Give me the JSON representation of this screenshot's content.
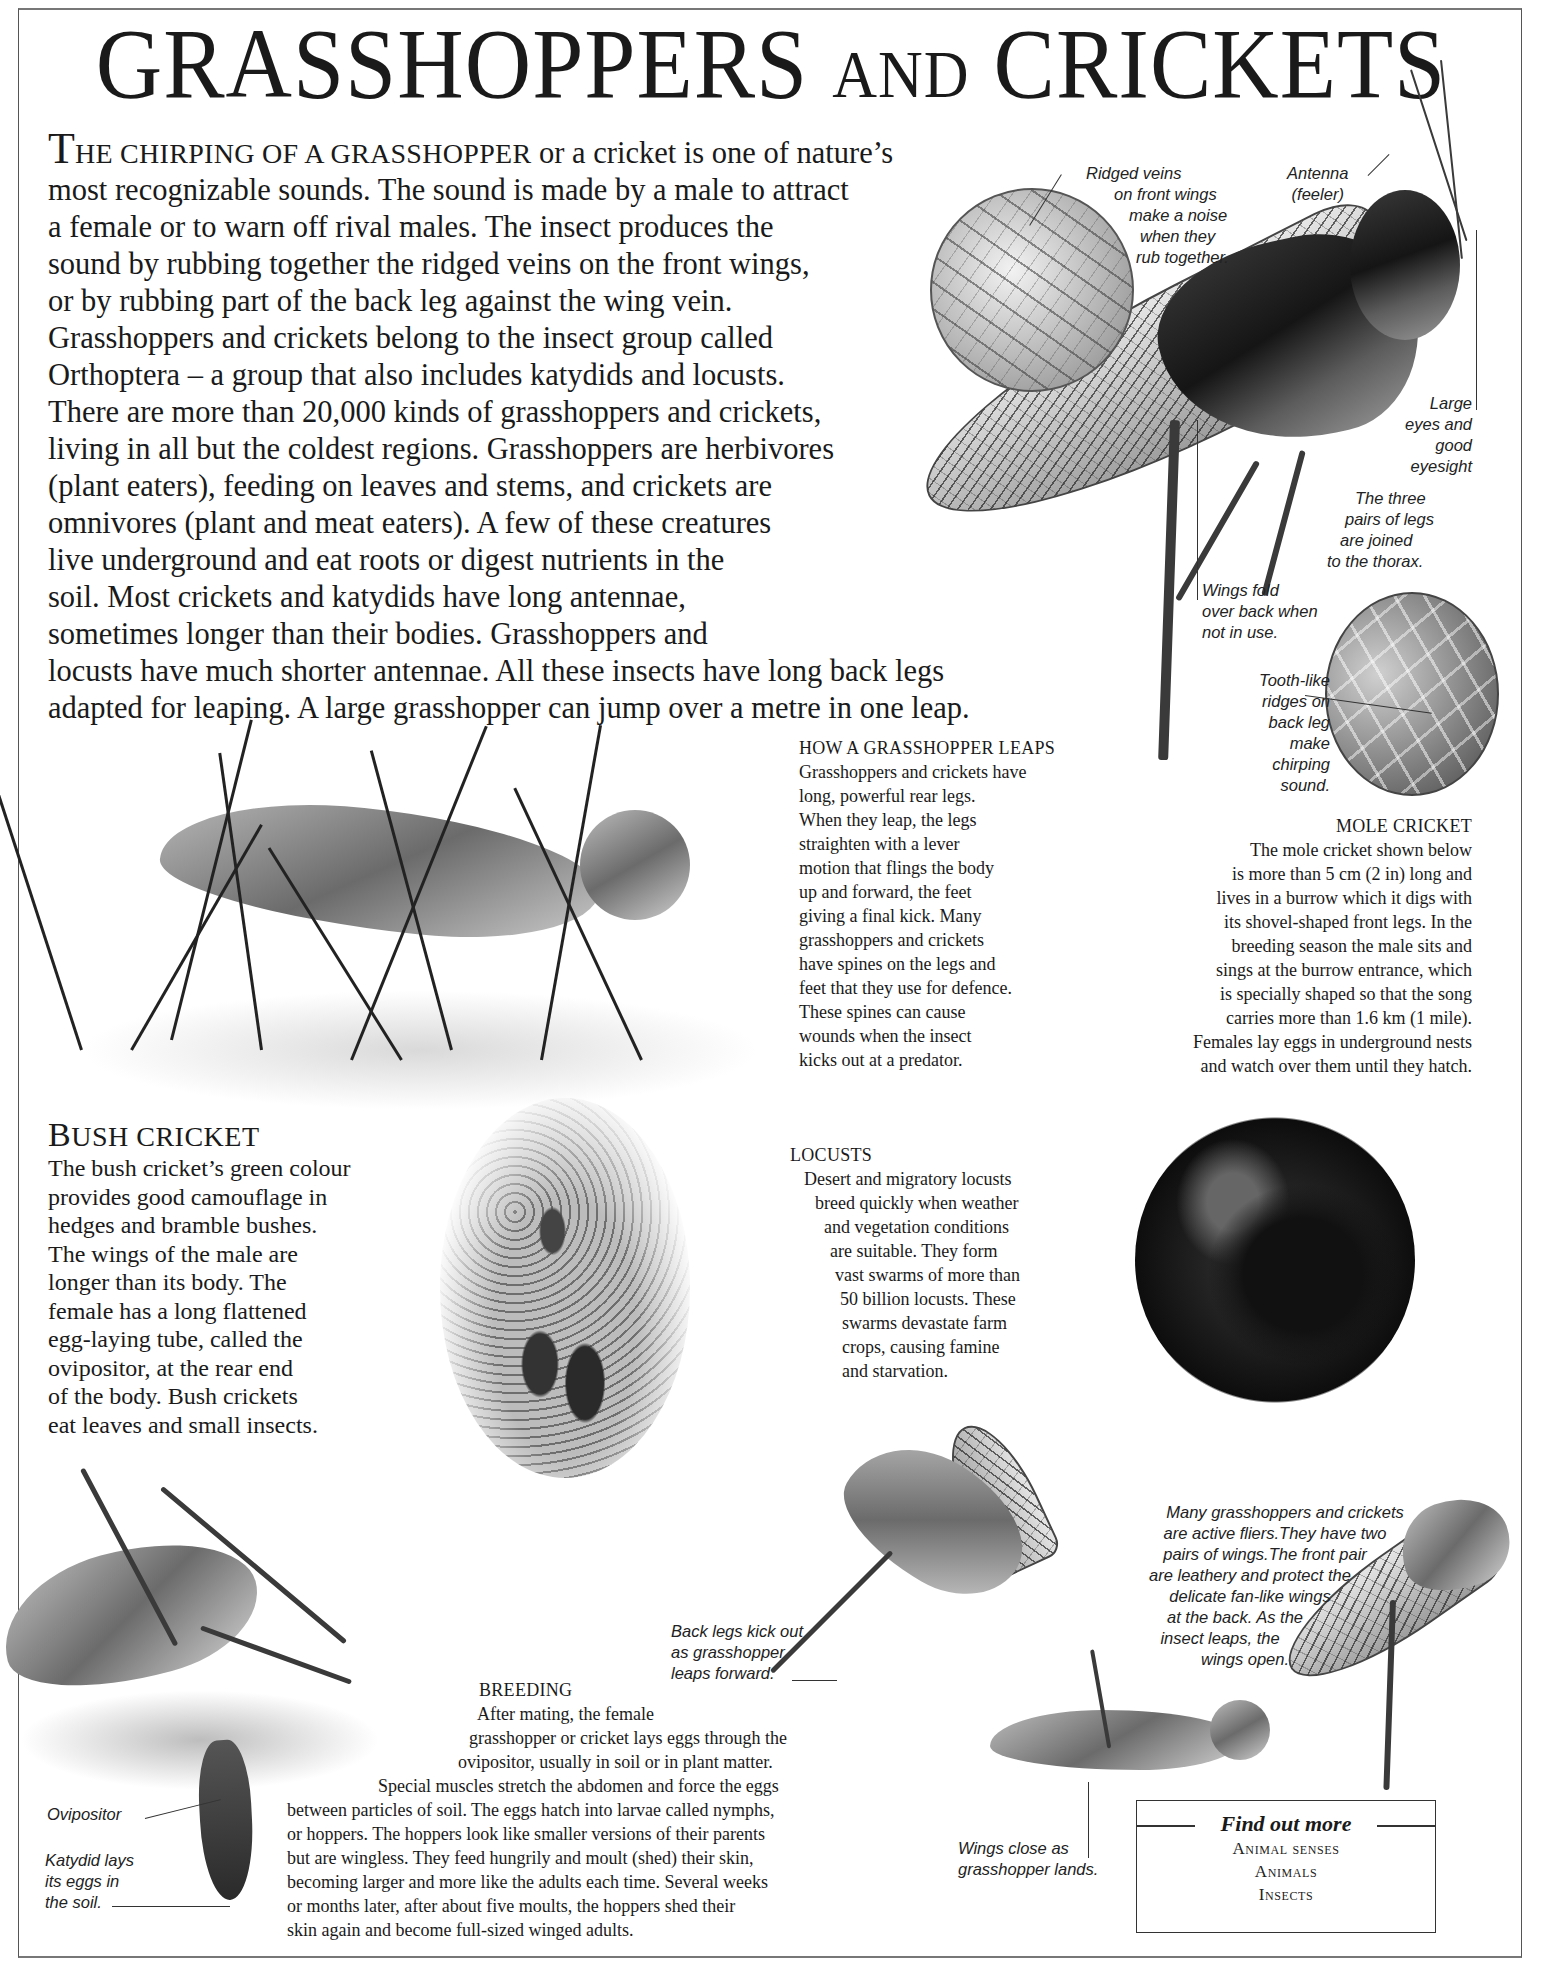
{
  "page": {
    "title_main": "GRASSHOPPERS",
    "title_and": "AND",
    "title_end": "CRICKETS"
  },
  "intro": {
    "dropcap": "T",
    "caps_lead": "HE CHIRPING OF A GRASSHOPPER",
    "lines": [
      " or a cricket is one of nature’s",
      "most recognizable sounds. The sound is made by a male to attract",
      "a female or to warn off rival males. The insect produces the",
      "sound by rubbing together the ridged veins on the front wings,",
      "or by rubbing part of the back leg against the wing vein.",
      "Grasshoppers and crickets belong to the insect group called",
      "Orthoptera – a group that also includes katydids and locusts.",
      "There are more than 20,000 kinds of grasshoppers and crickets,",
      "living in all but the coldest regions. Grasshoppers are herbivores",
      "(plant eaters), feeding on leaves and stems, and crickets are",
      "omnivores (plant and meat eaters). A few of these creatures",
      "live underground and eat roots or digest nutrients in the",
      "soil. Most crickets and katydids have long antennae,",
      "sometimes longer than their bodies. Grasshoppers and",
      "locusts have much shorter antennae. All these insects have long back legs",
      "adapted for leaping. A large grasshopper can jump over a metre in one leap."
    ]
  },
  "captions": {
    "ridged_veins": [
      "Ridged veins",
      "on front wings",
      "make a noise",
      "when they",
      "rub together."
    ],
    "antenna": [
      "Antenna",
      "(feeler)"
    ],
    "large_eyes": [
      "Large",
      "eyes and",
      "good",
      "eyesight"
    ],
    "three_pairs": [
      "The three",
      "pairs of legs",
      "are joined",
      "to the thorax."
    ],
    "wings_fold": [
      "Wings fold",
      "over back when",
      "not in use."
    ],
    "tooth_ridges": [
      "Tooth-like",
      "ridges on",
      "back leg",
      "make",
      "chirping",
      "sound."
    ],
    "active_fliers": [
      "Many grasshoppers and crickets",
      "are active fliers.They have two",
      "pairs of wings.The front pair",
      "are leathery and protect the",
      "delicate fan-like wings",
      "at the back. As the",
      "insect leaps, the",
      "wings open."
    ],
    "back_legs_kick": [
      "Back legs kick out",
      "as grasshopper",
      "leaps forward."
    ],
    "wings_close": [
      "Wings close as",
      "grasshopper lands."
    ],
    "ovipositor": [
      "Ovipositor"
    ],
    "katydid_lays": [
      "Katydid lays",
      "its eggs in",
      "the soil."
    ]
  },
  "sections": {
    "leaps": {
      "heading": "HOW A GRASSHOPPER LEAPS",
      "lines": [
        "Grasshoppers and crickets have",
        "long, powerful rear legs.",
        "When they leap, the legs",
        "straighten with a lever",
        "motion that flings the body",
        "up and forward, the feet",
        "giving a final kick. Many",
        "grasshoppers and crickets",
        "have spines on the legs and",
        "feet that they use for defence.",
        "These spines can cause",
        "wounds when the insect",
        "kicks out at a predator."
      ]
    },
    "mole": {
      "heading": "MOLE CRICKET",
      "lines": [
        "The mole cricket shown below",
        "is more than 5 cm (2 in) long and",
        "lives in a burrow which it digs with",
        "its shovel-shaped front legs. In the",
        "breeding season the male sits and",
        "sings at the burrow entrance, which",
        "is specially shaped so that the song",
        "carries more than 1.6 km (1 mile).",
        "Females lay eggs in underground nests",
        "and watch over them until they hatch."
      ]
    },
    "bush": {
      "heading_initial": "B",
      "heading_rest": "USH CRICKET",
      "lines": [
        "The bush cricket’s green colour",
        "provides good camouflage in",
        "hedges and bramble bushes.",
        "The wings of the male are",
        "longer than its body. The",
        "female has a long flattened",
        "egg-laying tube, called the",
        "ovipositor, at the rear end",
        "of the body. Bush crickets",
        "eat leaves and small insects."
      ]
    },
    "locusts": {
      "heading": "LOCUSTS",
      "lines": [
        "Desert and migratory locusts",
        "breed quickly when weather",
        "and vegetation conditions",
        "are suitable. They form",
        "vast swarms of more than",
        "50 billion locusts. These",
        "swarms devastate farm",
        "crops, causing famine",
        "and starvation."
      ]
    },
    "breeding": {
      "heading": "BREEDING",
      "lines": [
        "After mating, the female",
        "grasshopper or cricket lays eggs through the",
        "ovipositor, usually in soil or in plant matter.",
        "Special muscles stretch the abdomen and force the eggs",
        "between particles of soil. The eggs hatch into larvae called nymphs,",
        "or hoppers. The hoppers look like smaller versions of their parents",
        "but are wingless. They feed hungrily and moult (shed) their skin,",
        "becoming larger and more like the adults each time. Several weeks",
        "or months later, after about five moults, the hoppers shed their",
        "skin again and become full-sized winged adults."
      ]
    }
  },
  "find_out_more": {
    "heading": "Find out more",
    "links": [
      "Animal senses",
      "Animals",
      "Insects"
    ]
  }
}
